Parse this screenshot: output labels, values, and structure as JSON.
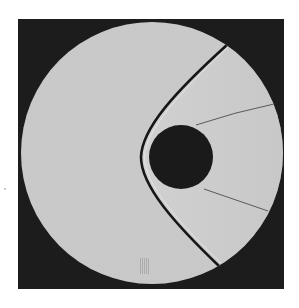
{
  "image": {
    "title": "Shadowgraph of bow shock ahead of a sphere in supersonic flow",
    "subject": "sphere-bow-shock",
    "colors": {
      "background": "#ffffff",
      "frame": "#1c1c1c",
      "field": "#c6c6c6",
      "sphere": "#1a1a1a",
      "shock": "#161616",
      "wake_lines": "#5a5a5a"
    },
    "elements": [
      "viewing-window",
      "sphere",
      "bow-shock",
      "upper-wake-line",
      "lower-wake-line",
      "film-mark"
    ]
  }
}
